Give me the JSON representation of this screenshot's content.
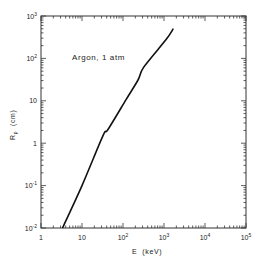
{
  "chart_data": {
    "type": "line",
    "title": "",
    "annotation": "Argon, 1 atm",
    "xlabel": "E  (keV)",
    "ylabel": "R",
    "ylabel_sub": "p",
    "ylabel_unit": "(cm)",
    "xscale": "log",
    "yscale": "log",
    "xlim": [
      1,
      100000
    ],
    "ylim": [
      0.01,
      1000
    ],
    "grid": false,
    "legend": "none",
    "x_ticks": [
      {
        "value": 1,
        "base": "1",
        "exp": ""
      },
      {
        "value": 10,
        "base": "10",
        "exp": ""
      },
      {
        "value": 100,
        "base": "10",
        "exp": "2"
      },
      {
        "value": 1000,
        "base": "10",
        "exp": "3"
      },
      {
        "value": 10000,
        "base": "10",
        "exp": "4"
      },
      {
        "value": 100000,
        "base": "10",
        "exp": "5"
      }
    ],
    "y_ticks": [
      {
        "value": 0.01,
        "base": "10",
        "exp": "-2"
      },
      {
        "value": 0.1,
        "base": "10",
        "exp": "-1"
      },
      {
        "value": 1,
        "base": "1",
        "exp": ""
      },
      {
        "value": 10,
        "base": "10",
        "exp": ""
      },
      {
        "value": 100,
        "base": "10",
        "exp": "2"
      },
      {
        "value": 1000,
        "base": "10",
        "exp": "3"
      }
    ],
    "series": [
      {
        "name": "Argon, 1 atm",
        "color": "#111111",
        "x": [
          3.4,
          10,
          32.5,
          43,
          118,
          232,
          324,
          1100,
          1660
        ],
        "y": [
          0.0104,
          0.1,
          1.5,
          2.1,
          10.5,
          31,
          63,
          270,
          490
        ]
      }
    ]
  }
}
